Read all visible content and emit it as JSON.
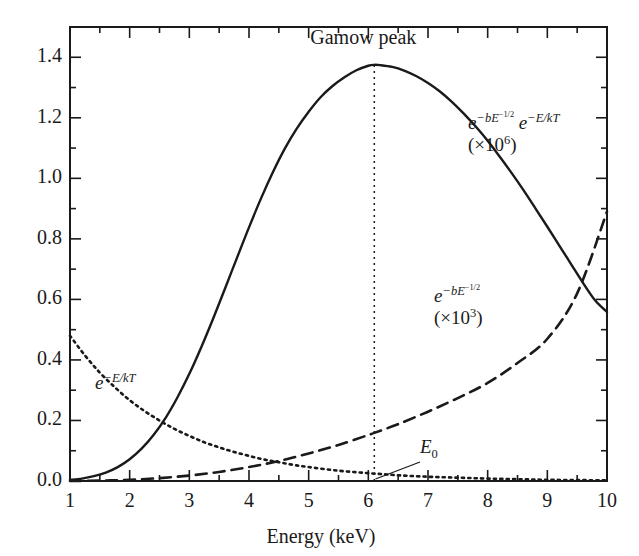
{
  "chart_data": {
    "type": "line",
    "title": "Gamow peak",
    "xlabel": "Energy (keV)",
    "ylabel": "",
    "xlim": [
      1,
      10
    ],
    "ylim": [
      0.0,
      1.5
    ],
    "xticks": [
      1,
      2,
      3,
      4,
      5,
      6,
      7,
      8,
      9,
      10
    ],
    "xtick_labels": [
      "1",
      "2",
      "3",
      "4",
      "5",
      "6",
      "7",
      "8",
      "9",
      "10"
    ],
    "xminor_step": 0.5,
    "yticks": [
      0.0,
      0.2,
      0.4,
      0.6,
      0.8,
      1.0,
      1.2,
      1.4
    ],
    "ytick_labels": [
      "0.0",
      "0.2",
      "0.4",
      "0.6",
      "0.8",
      "1.0",
      "1.2",
      "1.4"
    ],
    "yminor_step": 0.1,
    "grid": false,
    "legend": "none",
    "frame": "box",
    "annotations": [
      {
        "name": "gamow-peak-title",
        "text": "Gamow peak",
        "x": 6.1,
        "y": 1.48
      },
      {
        "name": "e0-marker",
        "text": "E0",
        "x": 6.6,
        "y": 0.11,
        "points_to": [
          6.1,
          0.0
        ]
      }
    ],
    "vertical_marker": {
      "name": "gamow-peak-line",
      "x": 6.1,
      "y_from": 0.0,
      "y_to": 1.375,
      "style": "dotted"
    },
    "series": [
      {
        "name": "gamow-peak",
        "label_line1_base": "e",
        "label_line1_exp": "-bE^{-1/2}",
        "label_line1_base2": "e",
        "label_line1_exp2": "-E/kT",
        "label_line2": "(×10⁶)",
        "style": "solid",
        "color": "#1a1a1a",
        "x": [
          1.0,
          1.2,
          1.4,
          1.6,
          1.8,
          2.0,
          2.2,
          2.4,
          2.6,
          2.8,
          3.0,
          3.2,
          3.4,
          3.6,
          3.8,
          4.0,
          4.2,
          4.4,
          4.6,
          4.8,
          5.0,
          5.2,
          5.4,
          5.6,
          5.8,
          6.0,
          6.1,
          6.2,
          6.4,
          6.6,
          6.8,
          7.0,
          7.2,
          7.4,
          7.6,
          7.8,
          8.0,
          8.2,
          8.4,
          8.6,
          8.8,
          9.0,
          9.2,
          9.4,
          9.6,
          9.8,
          10.0
        ],
        "y": [
          0.004,
          0.008,
          0.016,
          0.028,
          0.046,
          0.072,
          0.107,
          0.152,
          0.208,
          0.276,
          0.354,
          0.442,
          0.537,
          0.637,
          0.738,
          0.838,
          0.933,
          1.02,
          1.098,
          1.164,
          1.22,
          1.268,
          1.305,
          1.334,
          1.357,
          1.372,
          1.375,
          1.374,
          1.368,
          1.356,
          1.338,
          1.315,
          1.287,
          1.253,
          1.214,
          1.171,
          1.124,
          1.072,
          1.018,
          0.961,
          0.901,
          0.84,
          0.778,
          0.716,
          0.654,
          0.597,
          0.558
        ]
      },
      {
        "name": "tunneling-probability",
        "label_line1_base": "e",
        "label_line1_exp": "-bE^{-1/2}",
        "label_line2": "(×10³)",
        "style": "dashed",
        "color": "#1a1a1a",
        "x": [
          1.0,
          1.5,
          2.0,
          2.5,
          3.0,
          3.5,
          4.0,
          4.5,
          5.0,
          5.5,
          6.0,
          6.1,
          6.5,
          7.0,
          7.5,
          8.0,
          8.5,
          9.0,
          9.5,
          10.0
        ],
        "y": [
          0.0002,
          0.0012,
          0.004,
          0.0095,
          0.018,
          0.03,
          0.046,
          0.066,
          0.091,
          0.119,
          0.152,
          0.159,
          0.188,
          0.229,
          0.274,
          0.324,
          0.39,
          0.47,
          0.62,
          0.89
        ]
      },
      {
        "name": "maxwell-boltzmann",
        "label_line1_base": "e",
        "label_line1_exp": "-E/kT",
        "label_line2": "",
        "style": "dotted",
        "color": "#1a1a1a",
        "x": [
          1.0,
          1.25,
          1.5,
          1.75,
          2.0,
          2.25,
          2.5,
          2.75,
          3.0,
          3.25,
          3.5,
          3.75,
          4.0,
          4.25,
          4.5,
          4.75,
          5.0,
          5.5,
          6.0,
          6.5,
          7.0,
          7.5,
          8.0,
          8.5,
          9.0,
          9.5,
          10.0
        ],
        "y": [
          0.48,
          0.415,
          0.358,
          0.31,
          0.267,
          0.231,
          0.2,
          0.172,
          0.149,
          0.128,
          0.111,
          0.096,
          0.083,
          0.071,
          0.062,
          0.053,
          0.046,
          0.034,
          0.026,
          0.019,
          0.014,
          0.011,
          0.008,
          0.006,
          0.004,
          0.003,
          0.002
        ]
      }
    ]
  },
  "labels": {
    "gamow_peak": "Gamow peak",
    "x_axis_title": "Energy (keV)",
    "e0": "E",
    "e0_sub": "0",
    "solid_label_l1a": "e",
    "solid_label_l1a_exp": "−bE",
    "solid_label_l1a_exp2": "−1/2",
    "solid_label_l1b": "e",
    "solid_label_l1b_exp": "−E/kT",
    "solid_label_l2": "(×10",
    "solid_label_l2_exp": "6",
    "solid_label_l2_close": ")",
    "dashed_label_l1": "e",
    "dashed_label_l1_exp": "−bE",
    "dashed_label_l1_exp2": "−1/2",
    "dashed_label_l2": "(×10",
    "dashed_label_l2_exp": "3",
    "dashed_label_l2_close": ")",
    "dotted_label": "e",
    "dotted_label_exp": "−E/kT"
  },
  "ytick_labels": [
    "1.4",
    "1.2",
    "1.0",
    "0.8",
    "0.6",
    "0.4",
    "0.2",
    "0.0"
  ],
  "xtick_labels": [
    "1",
    "2",
    "3",
    "4",
    "5",
    "6",
    "7",
    "8",
    "9",
    "10"
  ]
}
